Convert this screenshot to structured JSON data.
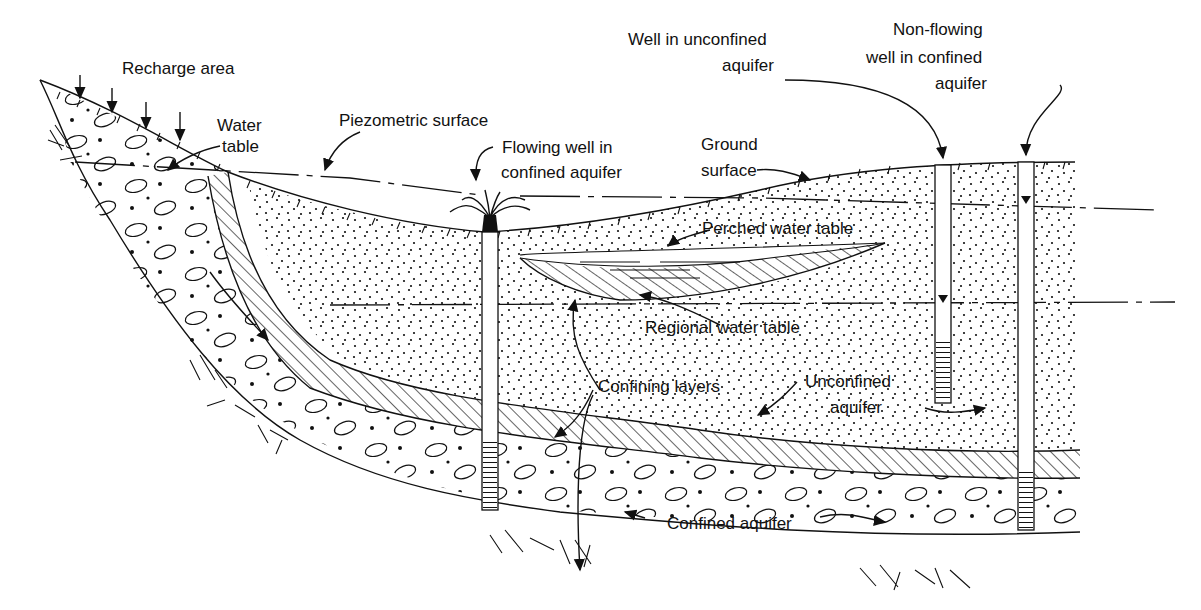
{
  "diagram": {
    "colors": {
      "ink": "#111111",
      "background": "#ffffff"
    },
    "labels": {
      "recharge_area": "Recharge area",
      "water_table_1": "Water",
      "water_table_2": "table",
      "piezometric_surface": "Piezometric surface",
      "flowing_well_1": "Flowing well in",
      "flowing_well_2": "confined aquifer",
      "ground_surface_1": "Ground",
      "ground_surface_2": "surface",
      "well_unconfined_1": "Well in unconfined",
      "well_unconfined_2": "aquifer",
      "nonflowing_well_1": "Non-flowing",
      "nonflowing_well_2": "well in confined",
      "nonflowing_well_3": "aquifer",
      "perched_water_table": "Perched water table",
      "regional_water_table": "Regional water table",
      "confining_layers": "Confining layers",
      "unconfined_aquifer_1": "Unconfined",
      "unconfined_aquifer_2": "aquifer",
      "confined_aquifer": "Confined aquifer"
    },
    "components": [
      "recharge-area",
      "water-table",
      "piezometric-surface",
      "flowing-well",
      "ground-surface",
      "well-in-unconfined-aquifer",
      "non-flowing-well",
      "perched-water-table",
      "regional-water-table",
      "confining-layers",
      "unconfined-aquifer",
      "confined-aquifer"
    ]
  }
}
